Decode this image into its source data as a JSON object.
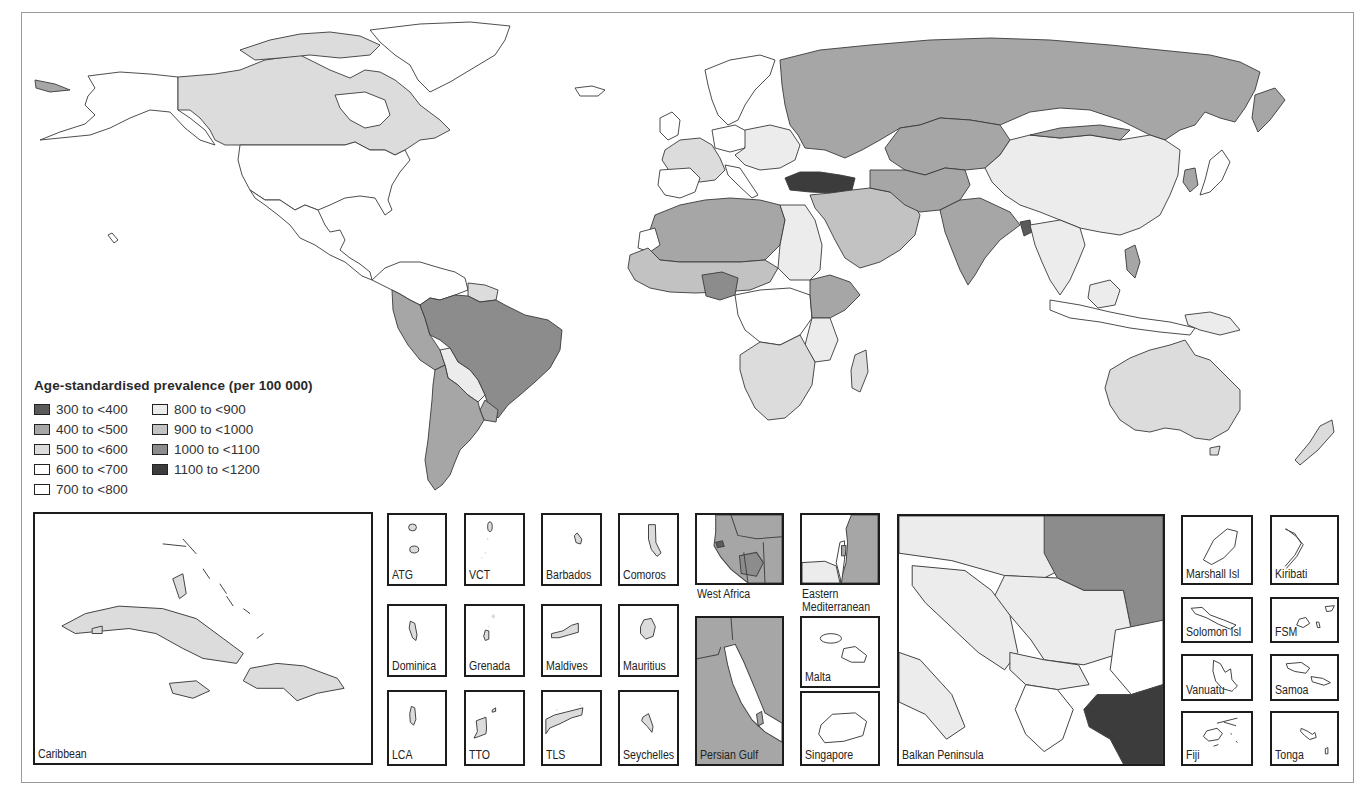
{
  "figure": {
    "legend": {
      "title": "Age-standardised prevalence (per 100 000)",
      "classes": [
        {
          "label": "300 to <400",
          "color": "#5a5a5a"
        },
        {
          "label": "400 to <500",
          "color": "#a6a6a6"
        },
        {
          "label": "500 to <600",
          "color": "#dcdcdc"
        },
        {
          "label": "600 to <700",
          "color": "#ffffff"
        },
        {
          "label": "700 to <800",
          "color": "#ffffff"
        },
        {
          "label": "800 to <900",
          "color": "#ececec"
        },
        {
          "label": "900 to <1000",
          "color": "#c2c2c2"
        },
        {
          "label": "1000 to <1100",
          "color": "#8c8c8c"
        },
        {
          "label": "1100 to <1200",
          "color": "#3c3c3c"
        }
      ]
    },
    "regions": {
      "canada": "500 to <600",
      "usa": "600 to <700",
      "greenland": "600 to <700",
      "mexico_central_america": "600 to <700",
      "brazil": "1000 to <1100",
      "andean": "400 to <500",
      "argentina_chile": "400 to <500",
      "bolivia_paraguay": "800 to <900",
      "russia_central_asia": "400 to <500",
      "china": "800 to <900",
      "india": "400 to <500",
      "turkey": "1100 to <1200",
      "nigeria": "1000 to <1100",
      "north_africa": "400 to <500",
      "sahel": "900 to <1000",
      "egypt_sudan": "800 to <900",
      "central_africa": "600 to <700",
      "southern_africa": "500 to <600",
      "east_africa": "400 to <500",
      "europe_west": "500 to <600",
      "europe_east": "800 to <900",
      "middle_east": "900 to <1000",
      "australia": "500 to <600",
      "southeast_asia": "800 to <900"
    },
    "insets": [
      {
        "id": "caribbean",
        "label": "Caribbean"
      },
      {
        "id": "atg",
        "label": "ATG"
      },
      {
        "id": "vct",
        "label": "VCT"
      },
      {
        "id": "barbados",
        "label": "Barbados"
      },
      {
        "id": "comoros",
        "label": "Comoros"
      },
      {
        "id": "dominica",
        "label": "Dominica"
      },
      {
        "id": "grenada",
        "label": "Grenada"
      },
      {
        "id": "maldives",
        "label": "Maldives"
      },
      {
        "id": "mauritius",
        "label": "Mauritius"
      },
      {
        "id": "lca",
        "label": "LCA"
      },
      {
        "id": "tto",
        "label": "TTO"
      },
      {
        "id": "tls",
        "label": "TLS"
      },
      {
        "id": "seychelles",
        "label": "Seychelles"
      },
      {
        "id": "west-africa",
        "label": "West Africa"
      },
      {
        "id": "eastern-mediterranean",
        "label": "Eastern\nMediterranean",
        "line1": "Eastern",
        "line2": "Mediterranean"
      },
      {
        "id": "persian-gulf",
        "label": "Persian Gulf"
      },
      {
        "id": "malta",
        "label": "Malta"
      },
      {
        "id": "singapore",
        "label": "Singapore"
      },
      {
        "id": "balkan-peninsula",
        "label": "Balkan Peninsula"
      },
      {
        "id": "marshall-isl",
        "label": "Marshall Isl"
      },
      {
        "id": "kiribati",
        "label": "Kiribati"
      },
      {
        "id": "solomon-isl",
        "label": "Solomon Isl"
      },
      {
        "id": "fsm",
        "label": "FSM"
      },
      {
        "id": "vanuatu",
        "label": "Vanuatu"
      },
      {
        "id": "samoa",
        "label": "Samoa"
      },
      {
        "id": "fiji",
        "label": "Fiji"
      },
      {
        "id": "tonga",
        "label": "Tonga"
      }
    ]
  }
}
